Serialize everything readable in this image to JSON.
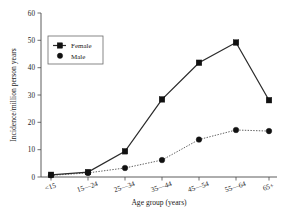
{
  "chart_data": {
    "type": "line",
    "title": "",
    "subtitle": "",
    "xlabel": "Age group (years)",
    "ylabel": "Incidence/million person years",
    "categories": [
      "<15",
      "15—24",
      "25—34",
      "35—44",
      "45—54",
      "55—64",
      "65+"
    ],
    "series": [
      {
        "name": "Female",
        "marker": "square",
        "linestyle": "solid",
        "color": "#2b2b2b",
        "values": [
          0.8,
          1.8,
          9.4,
          28.4,
          41.8,
          49.2,
          28.1
        ]
      },
      {
        "name": "Male",
        "marker": "circle",
        "linestyle": "dotted",
        "color": "#4d4d4d",
        "values": [
          0.6,
          1.5,
          3.3,
          6.2,
          13.7,
          17.2,
          16.8
        ]
      }
    ],
    "ylim": [
      0,
      60
    ],
    "yticks": [
      0,
      10,
      20,
      30,
      40,
      50,
      60
    ],
    "ytick_labels": [
      "0",
      "10",
      "20",
      "30",
      "40",
      "50",
      "60"
    ],
    "grid": false,
    "legend_position": "upper left",
    "xtick_label_rotation": -20,
    "spines": [
      "left",
      "bottom"
    ],
    "background": "#ffffff"
  },
  "legend": {
    "entries": [
      {
        "label": "Female",
        "marker_icon": "filled-square-marker"
      },
      {
        "label": "Male",
        "marker_icon": "filled-circle-marker"
      }
    ]
  },
  "axes": {
    "y_axis_title": "Incidence/million person years",
    "x_axis_title": "Age group (years)",
    "y_tick_0": "0",
    "y_tick_1": "10",
    "y_tick_2": "20",
    "y_tick_3": "30",
    "y_tick_4": "40",
    "y_tick_5": "50",
    "y_tick_6": "60",
    "x_tick_0": "<15",
    "x_tick_1": "15—24",
    "x_tick_2": "25—34",
    "x_tick_3": "35—44",
    "x_tick_4": "45—54",
    "x_tick_5": "55—64",
    "x_tick_6": "65+"
  }
}
